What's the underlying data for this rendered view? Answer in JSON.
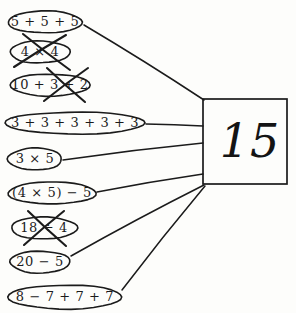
{
  "worksheet": {
    "title": "Number bond matching worksheet",
    "background_color": "#fdfdfb",
    "ink_color": "#1b1b1b",
    "answer": {
      "value": "15",
      "box": {
        "x": 203,
        "y": 99,
        "width": 84,
        "height": 85
      }
    },
    "options": [
      {
        "id": "opt-1",
        "text": "5 + 5 + 5",
        "crossed_out": false,
        "connected": true,
        "oval": {
          "cx": 45,
          "cy": 22,
          "rx": 37,
          "ry": 11
        },
        "font_size": 13
      },
      {
        "id": "opt-2",
        "text": "4 × 4",
        "crossed_out": true,
        "connected": false,
        "oval": {
          "cx": 40,
          "cy": 52,
          "rx": 30,
          "ry": 11
        },
        "font_size": 13
      },
      {
        "id": "opt-3",
        "text": "10 + 3 + 2",
        "crossed_out": true,
        "connected": false,
        "oval": {
          "cx": 50,
          "cy": 85,
          "rx": 40,
          "ry": 11
        },
        "font_size": 13
      },
      {
        "id": "opt-4",
        "text": "3 + 3 + 3 + 3 + 3",
        "crossed_out": false,
        "connected": true,
        "oval": {
          "cx": 75,
          "cy": 123,
          "rx": 70,
          "ry": 11
        },
        "font_size": 13
      },
      {
        "id": "opt-5",
        "text": "3 × 5",
        "crossed_out": false,
        "connected": true,
        "oval": {
          "cx": 35,
          "cy": 159,
          "rx": 27,
          "ry": 11
        },
        "font_size": 13
      },
      {
        "id": "opt-6",
        "text": "(4 × 5) − 5",
        "crossed_out": false,
        "connected": true,
        "oval": {
          "cx": 52,
          "cy": 193,
          "rx": 44,
          "ry": 11
        },
        "font_size": 13
      },
      {
        "id": "opt-7",
        "text": "18 ÷ 4",
        "crossed_out": true,
        "connected": false,
        "oval": {
          "cx": 44,
          "cy": 228,
          "rx": 33,
          "ry": 11
        },
        "font_size": 13
      },
      {
        "id": "opt-8",
        "text": "20 − 5",
        "crossed_out": false,
        "connected": true,
        "oval": {
          "cx": 40,
          "cy": 262,
          "rx": 30,
          "ry": 11
        },
        "font_size": 13
      },
      {
        "id": "opt-9",
        "text": "8 − 7 + 7 + 7",
        "crossed_out": false,
        "connected": true,
        "oval": {
          "cx": 65,
          "cy": 297,
          "rx": 57,
          "ry": 12
        },
        "font_size": 13
      }
    ],
    "connectors": [
      {
        "id": "line-1",
        "from": "opt-1",
        "x1": 84,
        "y1": 25,
        "x2": 204,
        "y2": 100
      },
      {
        "id": "line-4",
        "from": "opt-4",
        "x1": 146,
        "y1": 124,
        "x2": 203,
        "y2": 126
      },
      {
        "id": "line-5",
        "from": "opt-5",
        "x1": 63,
        "y1": 160,
        "x2": 203,
        "y2": 143
      },
      {
        "id": "line-6",
        "from": "opt-6",
        "x1": 97,
        "y1": 192,
        "x2": 203,
        "y2": 174
      },
      {
        "id": "line-8",
        "from": "opt-8",
        "x1": 71,
        "y1": 256,
        "x2": 204,
        "y2": 185
      },
      {
        "id": "line-9",
        "from": "opt-9",
        "x1": 122,
        "y1": 290,
        "x2": 205,
        "y2": 186
      }
    ],
    "strikes": [
      {
        "id": "strike-2",
        "for": "opt-2",
        "ax1": 14,
        "ay1": 67,
        "ax2": 66,
        "ay2": 35,
        "bx1": 23,
        "by1": 34,
        "bx2": 70,
        "by2": 70
      },
      {
        "id": "strike-3",
        "for": "opt-3",
        "ax1": 44,
        "ay1": 101,
        "ax2": 88,
        "ay2": 68,
        "bx1": 47,
        "by1": 68,
        "bx2": 85,
        "by2": 102
      },
      {
        "id": "strike-7",
        "for": "opt-7",
        "ax1": 24,
        "ay1": 245,
        "ax2": 64,
        "ay2": 211,
        "bx1": 28,
        "by1": 211,
        "bx2": 66,
        "by2": 246
      }
    ]
  }
}
